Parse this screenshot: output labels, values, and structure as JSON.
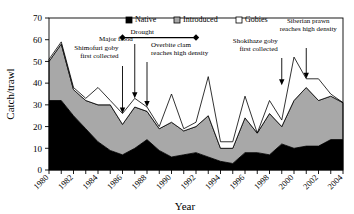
{
  "chart_data": {
    "type": "area",
    "title": "",
    "xlabel": "Year",
    "ylabel": "Catch/trawl",
    "xlim": [
      1980,
      2004
    ],
    "ylim": [
      0,
      70
    ],
    "ytick_step": 10,
    "yticks": [
      0,
      10,
      20,
      30,
      40,
      50,
      60,
      70
    ],
    "xticks": [
      1980,
      1981,
      1982,
      1983,
      1984,
      1985,
      1986,
      1987,
      1988,
      1989,
      1990,
      1991,
      1992,
      1993,
      1994,
      1995,
      1996,
      1997,
      1998,
      1999,
      2000,
      2001,
      2002,
      2003,
      2004
    ],
    "xtick_labels": [
      "1980",
      "",
      "1982",
      "",
      "1984",
      "",
      "1986",
      "",
      "1988",
      "",
      "1990",
      "",
      "1992",
      "",
      "1994",
      "",
      "1996",
      "",
      "1998",
      "",
      "2000",
      "",
      "2002",
      "",
      "2004"
    ],
    "grid": false,
    "stacked": true,
    "legend_position": "top-center",
    "x": [
      1980,
      1981,
      1982,
      1983,
      1984,
      1985,
      1986,
      1987,
      1988,
      1989,
      1990,
      1991,
      1992,
      1993,
      1994,
      1995,
      1996,
      1997,
      1998,
      1999,
      2000,
      2001,
      2002,
      2003,
      2004
    ],
    "series": [
      {
        "name": "Native",
        "color": "#000000",
        "values": [
          32,
          32,
          25,
          19,
          13,
          9,
          7,
          10,
          14,
          9,
          6,
          7,
          8,
          6,
          4,
          3,
          8,
          8,
          7,
          12,
          10,
          11,
          11,
          14,
          14
        ]
      },
      {
        "name": "Introduced",
        "color": "#a8a8a8",
        "values": [
          18,
          26,
          12,
          13,
          17,
          21,
          14,
          19,
          13,
          10,
          16,
          11,
          12,
          19,
          6,
          7,
          16,
          9,
          19,
          8,
          22,
          27,
          21,
          20,
          17
        ]
      },
      {
        "name": "Gobies",
        "color": "#ffffff",
        "values": [
          1,
          1,
          1,
          1,
          8,
          2,
          5,
          4,
          2,
          1,
          13,
          1,
          2,
          18,
          3,
          3,
          10,
          0,
          6,
          3,
          20,
          4,
          10,
          1,
          0
        ]
      }
    ],
    "totals": [
      51,
      59,
      38,
      33,
      38,
      32,
      26,
      33,
      29,
      20,
      35,
      19,
      22,
      43,
      13,
      13,
      34,
      17,
      32,
      23,
      52,
      42,
      42,
      35,
      31
    ],
    "annotations": [
      {
        "id": "drought",
        "label": "Drought",
        "type": "range-bar",
        "x_start": 1986,
        "x_end": 1992,
        "y": 61
      },
      {
        "id": "shimofuri-goby",
        "label": "Shimofuri goby\nfirst collected",
        "line1": "Shimofuri goby",
        "line2": "first collected",
        "type": "arrow",
        "x": 1986,
        "y_target": 26
      },
      {
        "id": "major-flood",
        "label": "Major flood",
        "line1": "Major flood",
        "line2": "",
        "type": "arrow",
        "x": 1987,
        "y_target": 33
      },
      {
        "id": "overbite-clam",
        "label": "Overbite clam\nreaches high density",
        "line1": "Overbite clam",
        "line2": "reaches high density",
        "type": "arrow",
        "x": 1988,
        "y_target": 29
      },
      {
        "id": "shokihaze-goby",
        "label": "Shokihaze goby\nfirst collected",
        "line1": "Shokihaze goby",
        "line2": "first collected",
        "type": "arrow",
        "x": 1999,
        "y_target": 39
      },
      {
        "id": "siberian-prawn",
        "label": "Siberian prawn\nreaches high density",
        "line1": "Siberian prawn",
        "line2": "reaches high density",
        "type": "arrow",
        "x": 2001,
        "y_target": 42
      }
    ],
    "legend": [
      {
        "label": "Native",
        "swatch": "solid-black"
      },
      {
        "label": "Introduced",
        "swatch": "hatched-gray"
      },
      {
        "label": "Gobies",
        "swatch": "open-white"
      }
    ]
  },
  "axes": {
    "y_title": "Catch/trawl",
    "x_title": "Year"
  }
}
